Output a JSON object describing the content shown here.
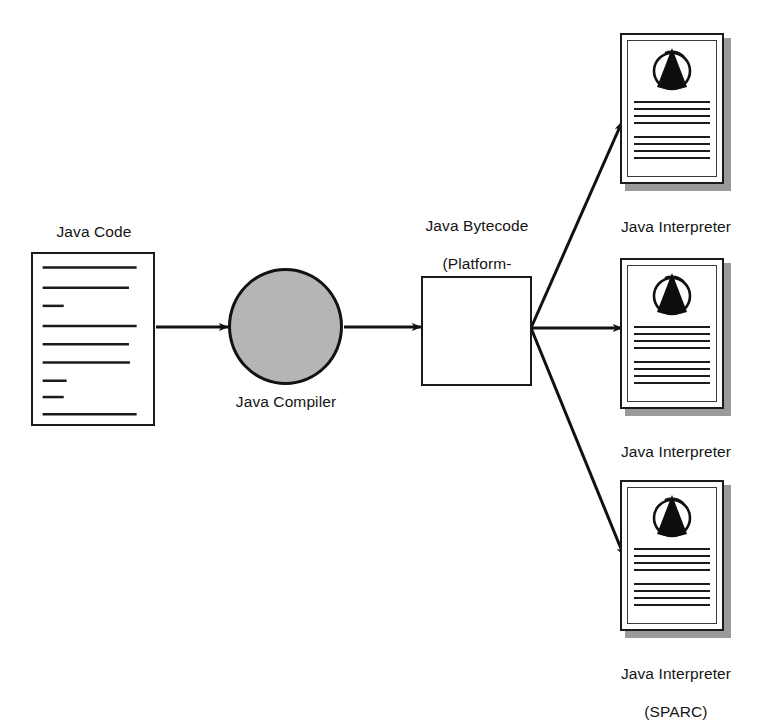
{
  "diagram": {
    "background_color": "#ffffff",
    "stroke_color": "#1a1a1a",
    "fill_gray": "#b5b5b5",
    "shadow_gray": "#9a9a9a"
  },
  "nodes": {
    "java_code": {
      "label": "Java Code",
      "shape": "document",
      "code_lines": [
        "long",
        "long",
        "short",
        "long",
        "long",
        "long",
        "short",
        "short",
        "long"
      ]
    },
    "java_compiler": {
      "label": "Java Compiler",
      "shape": "circle",
      "fill": "#b5b5b5"
    },
    "java_bytecode": {
      "label": "Java Bytecode\n(Platform-\nIndependent)",
      "label_line1": "Java Bytecode",
      "label_line2": "(Platform-",
      "label_line3": "Independent)",
      "shape": "rectangle",
      "fill": "#ffffff"
    }
  },
  "interpreters": [
    {
      "id": "pentium",
      "label": "Java Interpreter\n(SPARC)",
      "label_line1": "Java Interpreter",
      "label_line2": "(Pentium)",
      "platform": "Pentium",
      "logo": "java-duke-cone-icon",
      "text_line_groups": [
        4,
        4
      ]
    },
    {
      "id": "powerpc",
      "label_line1": "Java Interpreter",
      "label_line2": "(Power PC)",
      "platform": "Power PC",
      "logo": "java-duke-cone-icon",
      "text_line_groups": [
        4,
        4
      ]
    },
    {
      "id": "sparc",
      "label_line1": "Java Interpreter",
      "label_line2": "(SPARC)",
      "platform": "SPARC",
      "logo": "java-duke-cone-icon",
      "text_line_groups": [
        4,
        4
      ]
    }
  ],
  "edges": [
    {
      "id": "code-to-compiler",
      "from": "java_code",
      "to": "java_compiler",
      "style": "arrow"
    },
    {
      "id": "compiler-to-bytecode",
      "from": "java_compiler",
      "to": "java_bytecode",
      "style": "arrow"
    },
    {
      "id": "bytecode-to-pentium",
      "from": "java_bytecode",
      "to": "interpreter-pentium",
      "style": "arrow"
    },
    {
      "id": "bytecode-to-powerpc",
      "from": "java_bytecode",
      "to": "interpreter-powerpc",
      "style": "arrow"
    },
    {
      "id": "bytecode-to-sparc",
      "from": "java_bytecode",
      "to": "interpreter-sparc",
      "style": "arrow"
    }
  ]
}
